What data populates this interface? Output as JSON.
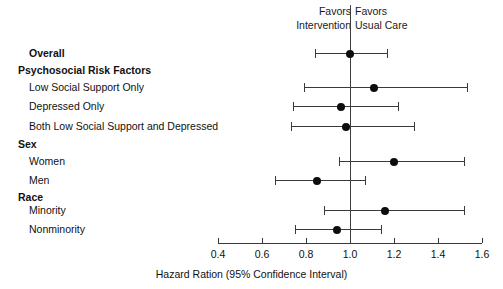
{
  "header": {
    "favors_left_line1": "Favors",
    "favors_left_line2": "Intervention",
    "favors_right_line1": "Favors",
    "favors_right_line2": "Usual Care"
  },
  "axis": {
    "title": "Hazard Ration (95% Confidence Interval)",
    "min": 0.4,
    "max": 1.6,
    "reference_value": 1.0,
    "ticks": [
      {
        "value": 0.4,
        "label": "0.4"
      },
      {
        "value": 0.6,
        "label": "0.6"
      },
      {
        "value": 0.8,
        "label": "0.8"
      },
      {
        "value": 1.0,
        "label": "1.0"
      },
      {
        "value": 1.2,
        "label": "1.2"
      },
      {
        "value": 1.4,
        "label": "1.4"
      },
      {
        "value": 1.6,
        "label": "1.6"
      }
    ]
  },
  "rows": [
    {
      "label": "Overall",
      "type": "item",
      "bold": true,
      "y": 53,
      "estimate": 1.0,
      "low": 0.84,
      "high": 1.17
    },
    {
      "label": "Psychosocial Risk Factors",
      "type": "group",
      "bold": true,
      "y": 70,
      "estimate": null,
      "low": null,
      "high": null
    },
    {
      "label": "Low Social Support Only",
      "type": "item",
      "bold": false,
      "y": 87,
      "estimate": 1.11,
      "low": 0.79,
      "high": 1.53
    },
    {
      "label": "Depressed Only",
      "type": "item",
      "bold": false,
      "y": 106,
      "estimate": 0.96,
      "low": 0.74,
      "high": 1.22
    },
    {
      "label": "Both Low Social Support and Depressed",
      "type": "item",
      "bold": false,
      "y": 126,
      "estimate": 0.98,
      "low": 0.73,
      "high": 1.29
    },
    {
      "label": "Sex",
      "type": "group",
      "bold": true,
      "y": 144,
      "estimate": null,
      "low": null,
      "high": null
    },
    {
      "label": "Women",
      "type": "item",
      "bold": false,
      "y": 161,
      "estimate": 1.2,
      "low": 0.95,
      "high": 1.52
    },
    {
      "label": "Men",
      "type": "item",
      "bold": false,
      "y": 180,
      "estimate": 0.85,
      "low": 0.66,
      "high": 1.07
    },
    {
      "label": "Race",
      "type": "group",
      "bold": true,
      "y": 197,
      "estimate": null,
      "low": null,
      "high": null
    },
    {
      "label": "Minority",
      "type": "item",
      "bold": false,
      "y": 210,
      "estimate": 1.16,
      "low": 0.88,
      "high": 1.52
    },
    {
      "label": "Nonminority",
      "type": "item",
      "bold": false,
      "y": 229,
      "estimate": 0.94,
      "low": 0.75,
      "high": 1.14
    }
  ],
  "chart_data": {
    "type": "scatter",
    "title": "",
    "xlabel": "Hazard Ration (95% Confidence Interval)",
    "ylabel": "",
    "xlim": [
      0.4,
      1.6
    ],
    "grid": false,
    "legend": "none",
    "reference_line": 1.0,
    "annotations": [
      "Favors Intervention",
      "Favors Usual Care"
    ],
    "categories": [
      "Overall",
      "Low Social Support Only",
      "Depressed Only",
      "Both Low Social Support and Depressed",
      "Women",
      "Men",
      "Minority",
      "Nonminority"
    ],
    "group_headings": [
      "Psychosocial Risk Factors",
      "Sex",
      "Race"
    ],
    "series": [
      {
        "name": "Hazard Ratio",
        "values": [
          1.0,
          1.11,
          0.96,
          0.98,
          1.2,
          0.85,
          1.16,
          0.94
        ],
        "ci_low": [
          0.84,
          0.79,
          0.74,
          0.73,
          0.95,
          0.66,
          0.88,
          0.75
        ],
        "ci_high": [
          1.17,
          1.53,
          1.22,
          1.29,
          1.52,
          1.07,
          1.52,
          1.14
        ]
      }
    ]
  },
  "colors": {
    "marker": "#0d0d0d",
    "line": "#3a3a3a",
    "text": "#111111",
    "background": "#ffffff"
  }
}
